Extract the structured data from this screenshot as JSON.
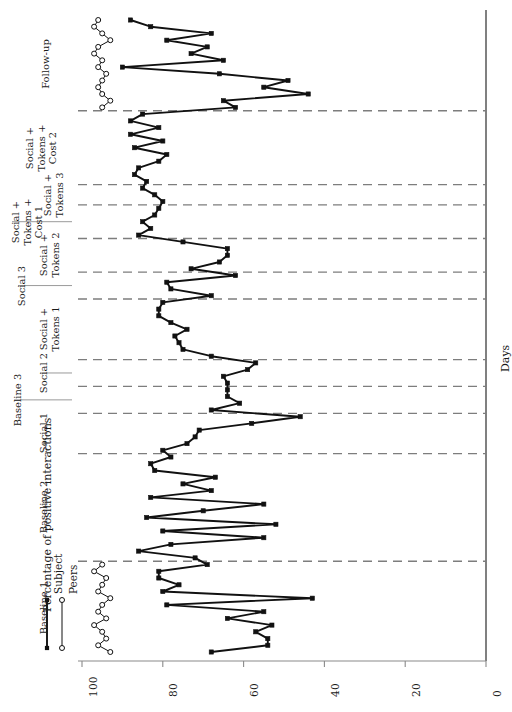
{
  "figure": {
    "type": "single-subject-multiple-phase-line-chart",
    "y_axis_title": "Percentage of positive interactions",
    "x_axis_title": "Days"
  },
  "legend": {
    "position": "bottom-left",
    "entries": [
      {
        "label": "Subject",
        "marker": "filled-square",
        "color": "#111111"
      },
      {
        "label": "Peers",
        "marker": "open-circle",
        "color": "#111111"
      }
    ]
  },
  "axis": {
    "y_ticks": [
      "0",
      "20",
      "40",
      "60",
      "80",
      "100"
    ],
    "y_tick_values": [
      0,
      20,
      40,
      60,
      80,
      100
    ],
    "ylim": [
      0,
      100
    ],
    "grid": false
  },
  "phases": [
    {
      "name": "Baseline 1",
      "index": 0,
      "day_start": 1,
      "day_end": 14
    },
    {
      "name": "Baseline 2",
      "index": 1,
      "day_start": 15,
      "day_end": 30
    },
    {
      "name": "Social 1",
      "index": 2,
      "day_start": 31,
      "day_end": 36
    },
    {
      "name": "Baseline 3",
      "index": 3,
      "day_start": 37,
      "day_end": 40
    },
    {
      "name": "Social 2",
      "index": 4,
      "day_start": 41,
      "day_end": 44
    },
    {
      "name": "Social +\nTokens 1",
      "index": 5,
      "day_start": 45,
      "day_end": 53
    },
    {
      "name": "Social 3",
      "index": 6,
      "day_start": 54,
      "day_end": 57
    },
    {
      "name": "Social +\nTokens 2",
      "index": 7,
      "day_start": 58,
      "day_end": 62
    },
    {
      "name": "Social +\nTokens +\nCost 1",
      "index": 8,
      "day_start": 63,
      "day_end": 67
    },
    {
      "name": "Social +\nTokens 3",
      "index": 9,
      "day_start": 68,
      "day_end": 70
    },
    {
      "name": "Social +\nTokens +\nCost 2",
      "index": 10,
      "day_start": 71,
      "day_end": 81
    },
    {
      "name": "Follow-up",
      "index": 11,
      "day_start": 82,
      "day_end": 95
    }
  ],
  "chart_data": {
    "type": "line",
    "title": "",
    "xlabel": "Days",
    "ylabel": "Percentage of positive interactions",
    "ylim": [
      0,
      100
    ],
    "grid": false,
    "legend_position": "bottom-left",
    "phase_dividers_after_day": [
      14,
      30,
      36,
      40,
      44,
      53,
      57,
      62,
      67,
      70,
      81
    ],
    "series": [
      {
        "name": "Subject",
        "marker": "filled-square",
        "x": [
          1,
          2,
          3,
          4,
          5,
          6,
          7,
          8,
          9,
          10,
          11,
          12,
          13,
          14,
          15,
          16,
          17,
          18,
          19,
          20,
          21,
          22,
          23,
          24,
          25,
          26,
          27,
          28,
          29,
          30,
          31,
          32,
          33,
          34,
          35,
          36,
          37,
          38,
          39,
          40,
          41,
          42,
          43,
          44,
          45,
          46,
          47,
          48,
          49,
          50,
          51,
          52,
          53,
          54,
          55,
          56,
          57,
          58,
          59,
          60,
          61,
          62,
          63,
          64,
          65,
          66,
          67,
          68,
          69,
          70,
          71,
          72,
          73,
          74,
          75,
          76,
          77,
          78,
          79,
          80,
          81,
          82,
          83,
          84,
          85,
          86,
          87,
          88,
          89,
          90,
          91,
          92,
          93,
          94,
          95
        ],
        "y": [
          68,
          54,
          54,
          57,
          53,
          64,
          55,
          79,
          43,
          80,
          76,
          81,
          81,
          69,
          72,
          86,
          78,
          55,
          80,
          52,
          84,
          70,
          55,
          83,
          68,
          75,
          67,
          82,
          83,
          78,
          80,
          74,
          72,
          71,
          58,
          46,
          68,
          61,
          64,
          64,
          64,
          65,
          59,
          57,
          68,
          75,
          76,
          77,
          74,
          78,
          81,
          81,
          80,
          68,
          78,
          79,
          62,
          73,
          66,
          64,
          64,
          75,
          86,
          83,
          85,
          82,
          81,
          80,
          82,
          85,
          84,
          87,
          86,
          81,
          79,
          87,
          80,
          88,
          81,
          88,
          85,
          62,
          65,
          44,
          55,
          49,
          66,
          90,
          65,
          73,
          69,
          79,
          68,
          83,
          88
        ],
        "note": "Subject positive-interaction percentages across all phases"
      },
      {
        "name": "Peers",
        "marker": "open-circle",
        "x": [
          1,
          2,
          3,
          4,
          5,
          6,
          7,
          8,
          9,
          10,
          11,
          12,
          13,
          14,
          82,
          83,
          84,
          85,
          86,
          87,
          88,
          89,
          90,
          91,
          92,
          93,
          94,
          95
        ],
        "y": [
          93,
          96,
          94,
          95,
          97,
          94,
          96,
          95,
          93,
          96,
          95,
          94,
          97,
          95,
          95,
          93,
          95,
          96,
          95,
          94,
          96,
          95,
          97,
          96,
          93,
          95,
          97,
          96
        ],
        "note": "Peer comparison data collected during Baseline 1 and Follow-up only"
      }
    ]
  }
}
